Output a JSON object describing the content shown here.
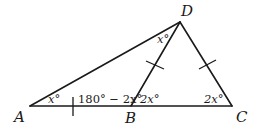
{
  "diagram": {
    "type": "geometry-triangle",
    "vertices": {
      "A": {
        "label": "A",
        "x": 30,
        "y": 106
      },
      "B": {
        "label": "B",
        "x": 131,
        "y": 106
      },
      "C": {
        "label": "C",
        "x": 232,
        "y": 106
      },
      "D": {
        "label": "D",
        "x": 180,
        "y": 22
      }
    },
    "segments": [
      "AC",
      "AD",
      "BD",
      "DC"
    ],
    "angle_labels": {
      "angle_A": "x°",
      "angle_ADB": "x°",
      "angle_ABD": "180° − 2x°",
      "angle_DBC": "2x°",
      "angle_C": "2x°"
    },
    "congruence_ticks": [
      "AB",
      "BD",
      "DC"
    ],
    "line_color": "#1a1a1a"
  }
}
